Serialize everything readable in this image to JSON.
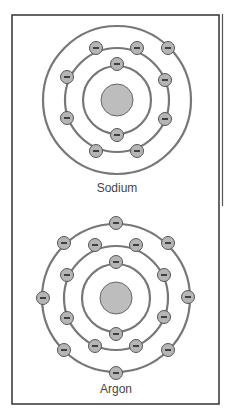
{
  "figure": {
    "colors": {
      "frame": "#333333",
      "shell": "#777777",
      "nucleus_fill": "#bdbdbd",
      "nucleus_stroke": "#666666",
      "electron_fill": "#b5b5b5",
      "electron_stroke": "#555555",
      "electron_sign": "#222222"
    },
    "atoms": [
      {
        "name": "Sodium",
        "label_x": 117,
        "label_y": 192,
        "center": [
          117,
          100
        ],
        "nucleus_r": 16,
        "shells": [
          34,
          52,
          74
        ],
        "electrons": [
          [
            117,
            64
          ],
          [
            117,
            135
          ],
          [
            96,
            48
          ],
          [
            137,
            48
          ],
          [
            67,
            77
          ],
          [
            165,
            80
          ],
          [
            67,
            118
          ],
          [
            165,
            119
          ],
          [
            96,
            151
          ],
          [
            137,
            151
          ],
          [
            168,
            48
          ]
        ]
      },
      {
        "name": "Argon",
        "label_x": 116,
        "label_y": 393,
        "center": [
          116,
          298
        ],
        "nucleus_r": 16,
        "shells": [
          34,
          52,
          74
        ],
        "electrons": [
          [
            116,
            262
          ],
          [
            116,
            334
          ],
          [
            95,
            245
          ],
          [
            136,
            245
          ],
          [
            67,
            275
          ],
          [
            164,
            275
          ],
          [
            67,
            318
          ],
          [
            164,
            317
          ],
          [
            95,
            346
          ],
          [
            136,
            346
          ],
          [
            116,
            223
          ],
          [
            64,
            243
          ],
          [
            168,
            243
          ],
          [
            43,
            298
          ],
          [
            188,
            297
          ],
          [
            64,
            350
          ],
          [
            168,
            350
          ],
          [
            116,
            373
          ]
        ]
      }
    ]
  },
  "labels": {
    "atom1": "Sodium",
    "atom2": "Argon"
  },
  "electron_sign": "−"
}
